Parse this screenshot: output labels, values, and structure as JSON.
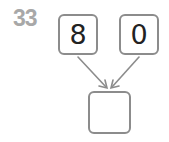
{
  "problem": {
    "number": "33",
    "top_left_value": "8",
    "top_right_value": "0",
    "answer_value": ""
  },
  "colors": {
    "number": "#a8a8a8",
    "border": "#8c8c8c",
    "arrow": "#8c8c8c"
  }
}
